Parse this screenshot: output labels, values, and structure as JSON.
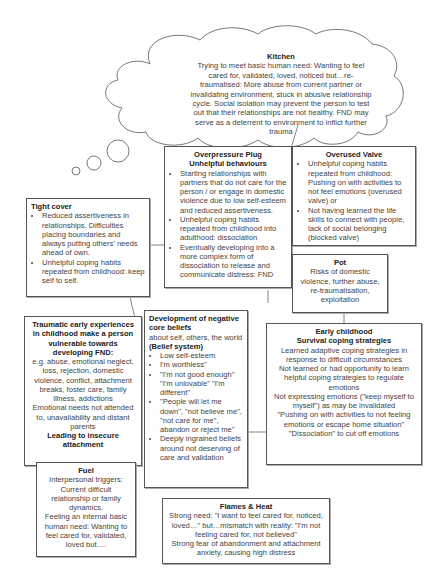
{
  "kitchen": {
    "title": "Kitchen",
    "text": "Trying to meet basic human need: Wanting to feel cared for, validated, loved, noticed but…re-traumatised: More abuse from current partner or invalidating environment, stuck in abusive relationship cycle. Social isolation may prevent the person to test out that their relationships are not healthy. FND may serve as a deterrent to environment to inflict further trauma"
  },
  "overpressure": {
    "title1": "Overpressure Plug",
    "title2": "Unhelpful behaviours",
    "items": [
      "Starting relationships with partners that do not care for the person / or engage in domestic violence due to low self-esteem and reduced assertiveness.",
      "Unhelpful coping habits repeated from childhood into adulthood: dissociation",
      "Eventually developing into a more complex form of dissociation to release and communicate distress: FND"
    ]
  },
  "valve": {
    "title": "Overused Valve",
    "items": [
      "Unhelpful coping habits repeated from childhood: Pushing on with activities to not feel emotions (overused valve) or",
      "Not having learned the life skills to connect with people, lack of social belonging (blocked valve)"
    ]
  },
  "cover": {
    "title": "Tight cover",
    "items": [
      "Reduced assertiveness in relationships. Difficulties placing boundaries and always putting others' needs ahead of own.",
      "Unhelpful coping habits repeated from childhood: keep self to self."
    ]
  },
  "pot": {
    "title": "Pot",
    "text": "Risks of domestic violence, further abuse, re-traumatisation, exploitation"
  },
  "traumatic": {
    "title": "Traumatic early experiences in childhood make a person vulnerable towards developing FND:",
    "text1": "e.g. abuse, emotional neglect, loss, rejection, domestic violence, conflict, attachment breaks, foster care, family illness, addictions",
    "text2": "Emotional needs not attended to, unavailability and distant parents",
    "footer": "Leading to insecure attachment"
  },
  "beliefs": {
    "title": "Development of negative core beliefs",
    "sub": "about self, others, the world",
    "sub_bold": "(Belief system)",
    "items": [
      "Low self-esteem",
      "I'm worthless\"",
      "\"I'm not good enough\" \"I'm unlovable\" \"I'm different\"",
      "\"People will let me down\", \"not believe me\", \"not care for me\", abandon or reject me\"",
      "Deeply ingrained beliefs around not deserving of care and validation"
    ]
  },
  "early": {
    "title1": "Early childhood",
    "title2": "Survival coping strategies",
    "lines": [
      "Learned adaptive coping strategies in response to difficult circumstances",
      "Not learned or had opportunity to learn helpful coping strategies to regulate emotions",
      "Not expressing emotions (\"keep myself to myself\") as may be invalidated",
      "\"Pushing on with activities to not feeling emotions or escape home situation\"",
      "\"Dissociation\" to cut off emotions"
    ]
  },
  "fuel": {
    "title": "Fuel",
    "text1": "Interpersonal triggers: Current difficult relationship or family dynamics.",
    "text2": "Feeling an internal basic human need: Wanting to feel cared for, validated, loved but…."
  },
  "flames": {
    "title": "Flames & Heat",
    "text1": "Strong need: \"I want to feel cared for, noticed, loved…\" but…mismatch with reality: \"I'm not feeling cared for, not believed\"",
    "text2": "Strong fear of abandonment and attachment anxiety, causing high distress"
  }
}
